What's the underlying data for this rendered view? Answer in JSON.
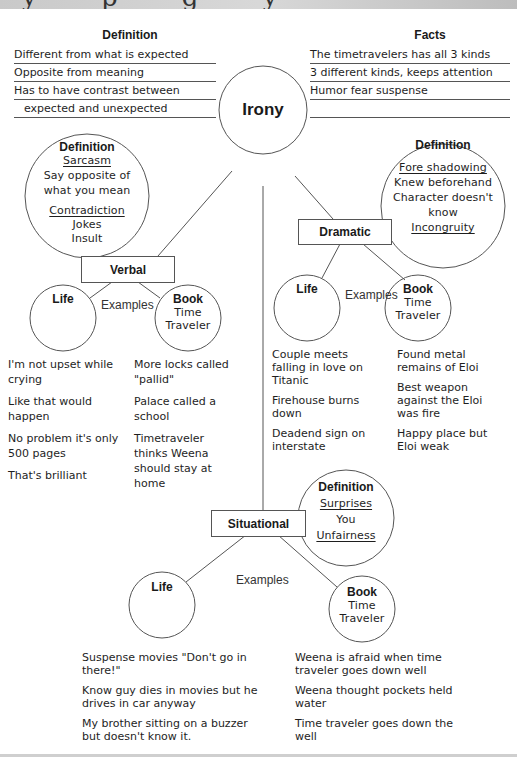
{
  "banner": {
    "partial_text": "y     p      g           y"
  },
  "top_left": {
    "heading": "Definition",
    "lines": [
      "Different from what is expected",
      "Opposite from meaning",
      "Has to have contrast between",
      "expected and unexpected"
    ]
  },
  "top_right": {
    "heading": "Facts",
    "lines": [
      "The timetravelers has all 3 kinds",
      "3 different kinds, keeps attention",
      "Humor fear suspense",
      ""
    ]
  },
  "center": {
    "label": "Irony"
  },
  "verbal": {
    "label": "Verbal",
    "definition": {
      "heading": "Definition",
      "term1": "Sarcasm",
      "term1_desc": [
        "Say opposite of",
        "what you mean"
      ],
      "term2": "Contradiction",
      "term2_desc": [
        "Jokes",
        "Insult"
      ]
    },
    "examples_label": "Examples",
    "life": {
      "label": "Life"
    },
    "book": {
      "label": "Book",
      "title": [
        "Time",
        "Traveler"
      ]
    },
    "life_examples": [
      "I'm not upset while crying",
      "Like that would happen",
      "No problem it's only 500 pages",
      "That's brilliant"
    ],
    "book_examples": [
      "More locks called \"pallid\"",
      "Palace called a school",
      "Timetraveler thinks Weena should stay at home"
    ]
  },
  "dramatic": {
    "label": "Dramatic",
    "definition": {
      "heading": "Definition",
      "term1": "Fore shadowing",
      "desc": [
        "Knew beforehand",
        "Character doesn't",
        "know"
      ],
      "term2": "Incongruity"
    },
    "examples_label": "Examples",
    "life": {
      "label": "Life"
    },
    "book": {
      "label": "Book",
      "title": [
        "Time",
        "Traveler"
      ]
    },
    "life_examples": [
      "Couple meets falling in love on Titanic",
      "Firehouse burns down",
      "Deadend sign on interstate"
    ],
    "book_examples": [
      "Found metal remains of Eloi",
      "Best weapon against the Eloi was fire",
      "Happy place but Eloi weak"
    ]
  },
  "situational": {
    "label": "Situational",
    "definition": {
      "heading": "Definition",
      "term1": "Surprises",
      "desc": "You",
      "term2": "Unfairness"
    },
    "examples_label": "Examples",
    "life": {
      "label": "Life"
    },
    "book": {
      "label": "Book",
      "title": [
        "Time",
        "Traveler"
      ]
    },
    "life_examples": [
      "Suspense movies \"Don't go in there!\"",
      "Know guy dies in movies but he drives in car anyway",
      "My brother sitting on a buzzer but doesn't know it."
    ],
    "book_examples": [
      "Weena is afraid when time traveler goes down well",
      "Weena thought pockets held water",
      "Time traveler goes down the well"
    ]
  },
  "colors": {
    "line": "#555555",
    "text": "#1e1e1e",
    "banner": "#c9c9c9"
  }
}
